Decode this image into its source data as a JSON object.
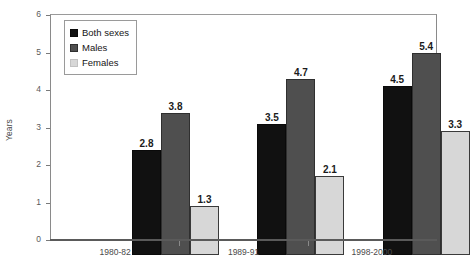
{
  "chart_data": {
    "type": "bar",
    "title": "",
    "xlabel": "",
    "ylabel": "Years",
    "ylim": [
      0,
      6
    ],
    "yticks": [
      0,
      1,
      2,
      3,
      4,
      5,
      6
    ],
    "grid": false,
    "legend_position": "top-left",
    "categories": [
      "1980-82",
      "1989-91",
      "1998-2000"
    ],
    "series": [
      {
        "name": "Both sexes",
        "color": "#111111",
        "values": [
          2.8,
          3.5,
          4.5
        ]
      },
      {
        "name": "Males",
        "color": "#4f4f4f",
        "values": [
          3.8,
          4.7,
          5.4
        ]
      },
      {
        "name": "Females",
        "color": "#d7d7d7",
        "values": [
          1.3,
          2.1,
          3.3
        ]
      }
    ],
    "value_labels": [
      [
        "2.8",
        "3.5",
        "4.5"
      ],
      [
        "3.8",
        "4.7",
        "5.4"
      ],
      [
        "1.3",
        "2.1",
        "3.3"
      ]
    ],
    "ytick_labels": [
      "0",
      "1",
      "2",
      "3",
      "4",
      "5",
      "6"
    ]
  },
  "axes": {
    "y_title": "Years"
  }
}
